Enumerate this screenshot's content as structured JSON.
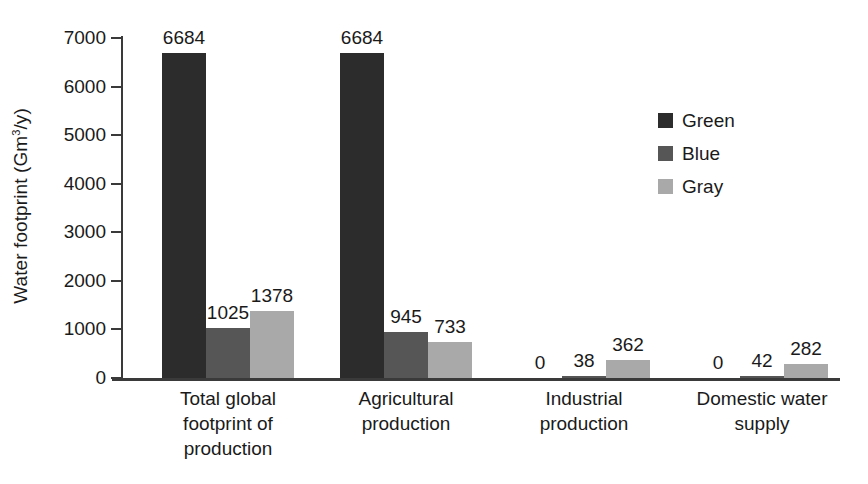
{
  "chart_data": {
    "type": "bar",
    "title": "",
    "subtitle": "",
    "xlabel": "",
    "ylabel": "Water footprint (Gm3/y)",
    "ylabel_parts": {
      "prefix": "Water footprint (Gm",
      "sup": "3",
      "suffix": "/y)"
    },
    "ylim": [
      0,
      7000
    ],
    "yticks": [
      0,
      1000,
      2000,
      3000,
      4000,
      5000,
      6000,
      7000
    ],
    "ytick_labels": [
      "0",
      "1000",
      "2000",
      "3000",
      "4000",
      "5000",
      "6000",
      "7000"
    ],
    "grid": false,
    "legend_position": "right",
    "categories": [
      "Total global footprint of production",
      "Agricultural production",
      "Industrial production",
      "Domestic water supply"
    ],
    "category_label_lines": [
      [
        "Total global",
        "footprint of",
        "production"
      ],
      [
        "Agricultural",
        "production"
      ],
      [
        "Industrial",
        "production"
      ],
      [
        "Domestic water",
        "supply"
      ]
    ],
    "series": [
      {
        "name": "Green",
        "color": "#2c2c2c",
        "values": [
          6684,
          6684,
          0,
          0
        ]
      },
      {
        "name": "Blue",
        "color": "#565656",
        "values": [
          1025,
          945,
          38,
          42
        ]
      },
      {
        "name": "Gray",
        "color": "#a9a9a9",
        "values": [
          1378,
          733,
          362,
          282
        ]
      }
    ],
    "data_labels": [
      [
        "6684",
        "1025",
        "1378"
      ],
      [
        "6684",
        "945",
        "733"
      ],
      [
        "0",
        "38",
        "362"
      ],
      [
        "0",
        "42",
        "282"
      ]
    ]
  },
  "legend": {
    "items": [
      {
        "label": "Green",
        "color": "#2c2c2c"
      },
      {
        "label": "Blue",
        "color": "#565656"
      },
      {
        "label": "Gray",
        "color": "#a9a9a9"
      }
    ]
  }
}
